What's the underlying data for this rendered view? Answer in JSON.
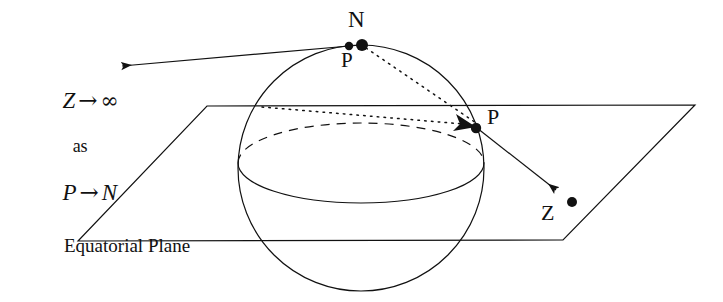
{
  "figure": {
    "type": "stereographic-projection-diagram",
    "background_color": "#ffffff",
    "stroke_color": "#111111"
  },
  "labels": {
    "north_pole": "N",
    "point_p_on_sphere_top": "P",
    "point_p_on_sphere_right": "P",
    "projected_point_z": "Z",
    "plane_caption": "Equatorial Plane"
  },
  "limit_statement": {
    "line1": {
      "variable": "Z",
      "arrow": "→",
      "target": "∞",
      "full": "Z → ∞"
    },
    "line2": "as",
    "line3": {
      "variable": "P",
      "arrow": "→",
      "target": "N",
      "full": "P → N"
    }
  },
  "geometry": {
    "sphere": {
      "cx": 361,
      "cy": 168,
      "r": 123
    },
    "equator_ellipse": {
      "cx": 361,
      "cy": 163,
      "rx": 123,
      "ry": 40
    },
    "plane_corners": [
      {
        "x": 207,
        "y": 106
      },
      {
        "x": 695,
        "y": 105
      },
      {
        "x": 563,
        "y": 240
      },
      {
        "x": 78,
        "y": 241
      }
    ],
    "points": {
      "N": {
        "x": 361,
        "y": 44,
        "radius": 6
      },
      "P_top": {
        "x": 349,
        "y": 46,
        "radius": 4
      },
      "P_right": {
        "x": 476,
        "y": 127,
        "radius": 5
      },
      "Z": {
        "x": 572,
        "y": 202,
        "radius": 5
      }
    },
    "arrow_to_infinity": {
      "from_x": 361,
      "from_y": 45,
      "to_x": 110,
      "to_y": 67
    },
    "arrow_to_z": {
      "from_x": 476,
      "from_y": 127,
      "to_x": 563,
      "to_y": 196
    },
    "dotted_ray_from_n": {
      "from_x": 365,
      "from_y": 47,
      "to_x": 478,
      "to_y": 126
    },
    "dotted_horizontal": {
      "from_x": 262,
      "from_y": 107,
      "to_x": 474,
      "to_y": 126
    }
  }
}
